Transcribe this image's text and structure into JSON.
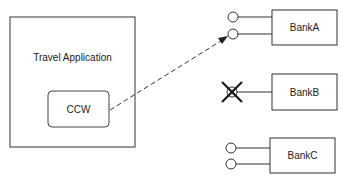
{
  "diagram": {
    "container": {
      "label": "Travel Application"
    },
    "component": {
      "label": "CCW"
    },
    "banks": [
      {
        "label": "BankA",
        "ports": 2,
        "status": "available"
      },
      {
        "label": "BankB",
        "ports": 1,
        "status": "unavailable"
      },
      {
        "label": "BankC",
        "ports": 2,
        "status": "available"
      }
    ],
    "connection": {
      "from": "CCW",
      "to": "BankA",
      "style": "dashed-arrow"
    }
  }
}
